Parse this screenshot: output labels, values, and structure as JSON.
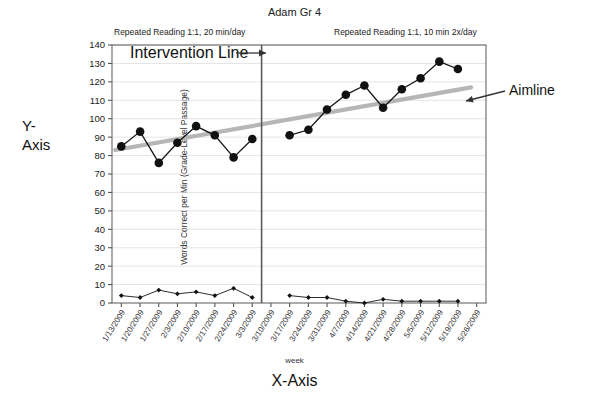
{
  "header": {
    "title": "Adam Gr 4"
  },
  "annotations": {
    "phase1_caption": "Repeated Reading 1:1, 20 min/day",
    "phase2_caption": "Repeated Reading 1:1, 10 min 2x/day",
    "intervention_label": "Intervention Line",
    "aimline_label": "Aimline",
    "y_axis_outer": "Y-\nAxis",
    "y_axis_outer_line1": "Y-",
    "y_axis_outer_line2": "Axis",
    "x_axis_outer": "X-Axis"
  },
  "chart_data": {
    "type": "line",
    "title": "Adam Gr 4",
    "xlabel": "week",
    "ylabel": "Words Correct per Min (Grade-Level Passage)",
    "ylim": [
      0,
      140
    ],
    "ytick_step": 10,
    "yticks": [
      0,
      10,
      20,
      30,
      40,
      50,
      60,
      70,
      80,
      90,
      100,
      110,
      120,
      130,
      140
    ],
    "grid": true,
    "legend": "none",
    "categories": [
      "1/13/2009",
      "1/20/2009",
      "1/27/2009",
      "2/3/2009",
      "2/10/2009",
      "2/17/2009",
      "2/24/2009",
      "3/3/2009",
      "3/10/2009",
      "3/17/2009",
      "3/24/2009",
      "3/31/2009",
      "4/7/2009",
      "4/14/2009",
      "4/21/2009",
      "4/28/2009",
      "5/5/2009",
      "5/12/2009",
      "5/19/2009",
      "5/26/2009"
    ],
    "series": [
      {
        "name": "Words Correct per Min",
        "marker": "circle",
        "color": "#111111",
        "values": [
          85,
          93,
          76,
          87,
          96,
          91,
          79,
          89,
          null,
          91,
          94,
          105,
          113,
          118,
          106,
          116,
          122,
          131,
          127,
          null
        ]
      },
      {
        "name": "Errors",
        "marker": "diamond",
        "color": "#111111",
        "values": [
          4,
          3,
          7,
          5,
          6,
          4,
          8,
          3,
          null,
          4,
          3,
          3,
          1,
          0,
          2,
          1,
          1,
          1,
          1,
          null
        ]
      }
    ],
    "trendline": {
      "name": "Aimline",
      "color": "#b6b6b6",
      "start": {
        "x_index": 0,
        "y": 83
      },
      "end": {
        "x_index": 18.7,
        "y": 117
      }
    },
    "phase_change": {
      "label": "Intervention Line",
      "after_x_index": 8,
      "phase1_caption": "Repeated Reading 1:1, 20 min/day",
      "phase2_caption": "Repeated Reading 1:1, 10 min 2x/day"
    }
  },
  "colors": {
    "aimline": "#b6b6b6",
    "data": "#111111",
    "grid": "#d8d8dd",
    "frame": "#666666",
    "phase_line": "#5a5a5a"
  }
}
